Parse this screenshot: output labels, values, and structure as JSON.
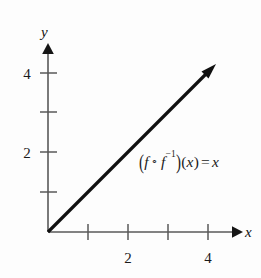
{
  "figure": {
    "kind": "cartesian-graph",
    "background_color": "#fdfdfd",
    "ink_color": "#1a1a1a",
    "axis_color": "#595959"
  },
  "axes": {
    "x": {
      "label": "x",
      "tick_values": [
        1,
        2,
        3,
        4
      ],
      "labeled_ticks": [
        {
          "value": 2,
          "text": "2"
        },
        {
          "value": 4,
          "text": "4"
        }
      ],
      "range": [
        0,
        4.75
      ],
      "arrow": true
    },
    "y": {
      "label": "y",
      "tick_values": [
        1,
        2,
        3,
        4
      ],
      "labeled_ticks": [
        {
          "value": 4,
          "text": "4"
        },
        {
          "value": 2,
          "text": "2"
        }
      ],
      "range": [
        0,
        4.7
      ],
      "arrow": true
    }
  },
  "curve": {
    "description": "identity-line",
    "from": [
      0,
      0
    ],
    "to": [
      4.1,
      4.1
    ],
    "slope": 1,
    "intercept": 0,
    "arrow_end": true,
    "color": "#101010",
    "width_px": 3.2
  },
  "annotation": {
    "equation_plain": "(f ∘ f⁻¹)(x) = x",
    "open_paren": "(",
    "f_first": "f",
    "composition_symbol": "∘",
    "f_second": "f",
    "inverse_exponent": "−1",
    "close_paren": ")",
    "argument_open": "(",
    "argument": "x",
    "argument_close": ")",
    "equals": "=",
    "result": "x"
  },
  "grid": {
    "show": false
  }
}
